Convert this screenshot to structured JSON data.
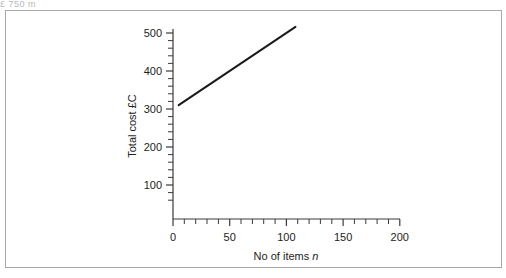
{
  "figure": {
    "top_cut_text": "£ 750 m",
    "frame_color": "#a8a8ac",
    "background": "#ffffff"
  },
  "chart_data": {
    "type": "line",
    "title": "",
    "subtitle": "",
    "xlabel": "No of items n",
    "xlabel_plain": "No of items ",
    "xlabel_italic": "n",
    "ylabel": "Total cost £C",
    "xlim": [
      0,
      200
    ],
    "ylim": [
      0,
      520
    ],
    "grid": false,
    "legend": null,
    "line_color": "#1a1a1a",
    "line_width": 2,
    "x_ticks": [
      0,
      50,
      100,
      150,
      200
    ],
    "x_tick_labels": [
      "0",
      "50",
      "100",
      "150",
      "200"
    ],
    "x_minor_step": 10,
    "y_ticks": [
      100,
      200,
      300,
      400,
      500
    ],
    "y_tick_labels": [
      "100",
      "200",
      "300",
      "400",
      "500"
    ],
    "y_minor_step": 20,
    "y_axis_min_drawn": 60,
    "series": [
      {
        "name": "Total cost",
        "equation": "C = 300 + 2n",
        "intercept": 300,
        "slope": 2,
        "x": [
          5,
          108
        ],
        "values": [
          310,
          516
        ],
        "points": [
          {
            "x": 5,
            "y": 310
          },
          {
            "x": 108,
            "y": 516
          }
        ]
      }
    ]
  }
}
